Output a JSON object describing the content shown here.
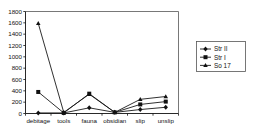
{
  "chart_data": {
    "type": "line",
    "title": "",
    "xlabel": "",
    "ylabel": "",
    "categories": [
      "debitage",
      "tools",
      "fauna",
      "obsidian",
      "slip",
      "unslip"
    ],
    "yticks": [
      0,
      200,
      400,
      600,
      800,
      1000,
      1200,
      1400,
      1600,
      1800
    ],
    "ylim": [
      0,
      1800
    ],
    "grid": false,
    "legend_position": "right",
    "series": [
      {
        "name": "Str II",
        "marker": "diamond",
        "values": [
          10,
          10,
          100,
          20,
          70,
          110
        ]
      },
      {
        "name": "Str I",
        "marker": "square",
        "values": [
          380,
          10,
          350,
          20,
          160,
          210
        ]
      },
      {
        "name": "So 17",
        "marker": "triangle",
        "values": [
          1590,
          20,
          340,
          20,
          250,
          300
        ]
      }
    ]
  },
  "legend": {
    "entries": [
      {
        "label": "Str II"
      },
      {
        "label": "Str I"
      },
      {
        "label": "So 17"
      }
    ]
  },
  "axis": {
    "y_tick_labels": [
      "1800",
      "1600",
      "1400",
      "1200",
      "1000",
      "800",
      "600",
      "400",
      "200",
      "0"
    ],
    "x_tick_labels": [
      "debitage",
      "tools",
      "fauna",
      "obsidian",
      "slip",
      "unslip"
    ]
  },
  "colors": {
    "ink": "#111111",
    "frame": "#555555",
    "background": "#ffffff"
  }
}
